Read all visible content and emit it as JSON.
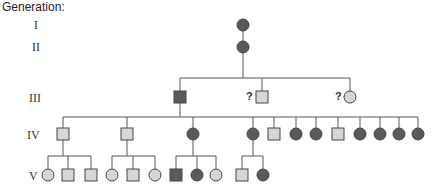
{
  "title": "Generation:",
  "generations": [
    "I",
    "II",
    "III",
    "IV",
    "V"
  ],
  "colors": {
    "affected": "#5a5a5a",
    "unaffected": "#d6d6d6",
    "stroke": "#444444",
    "line": "#555555"
  },
  "unknown_marker": "?",
  "legend": {
    "square": "male",
    "circle": "female",
    "dark": "affected",
    "light": "unaffected"
  },
  "individuals": {
    "I": [
      {
        "sex": "female",
        "affected": true
      }
    ],
    "II": [
      {
        "sex": "female",
        "affected": true
      }
    ],
    "III": [
      {
        "sex": "male",
        "affected": true
      },
      {
        "sex": "male",
        "affected": false,
        "unknown": true
      },
      {
        "sex": "female",
        "affected": false,
        "unknown": true
      }
    ],
    "IV": [
      {
        "sex": "male",
        "affected": false
      },
      {
        "sex": "male",
        "affected": false
      },
      {
        "sex": "female",
        "affected": true
      },
      {
        "sex": "female",
        "affected": true
      },
      {
        "sex": "male",
        "affected": false
      },
      {
        "sex": "female",
        "affected": true
      },
      {
        "sex": "female",
        "affected": true
      },
      {
        "sex": "male",
        "affected": false
      },
      {
        "sex": "female",
        "affected": true
      },
      {
        "sex": "female",
        "affected": true
      },
      {
        "sex": "female",
        "affected": true
      },
      {
        "sex": "female",
        "affected": true
      }
    ],
    "V": [
      {
        "sex": "female",
        "affected": false,
        "parent": "IV-1"
      },
      {
        "sex": "male",
        "affected": false,
        "parent": "IV-1"
      },
      {
        "sex": "male",
        "affected": false,
        "parent": "IV-1"
      },
      {
        "sex": "female",
        "affected": false,
        "parent": "IV-2"
      },
      {
        "sex": "male",
        "affected": false,
        "parent": "IV-2"
      },
      {
        "sex": "female",
        "affected": false,
        "parent": "IV-2"
      },
      {
        "sex": "male",
        "affected": true,
        "parent": "IV-3"
      },
      {
        "sex": "female",
        "affected": true,
        "parent": "IV-3"
      },
      {
        "sex": "female",
        "affected": false,
        "parent": "IV-3"
      },
      {
        "sex": "male",
        "affected": false,
        "parent": "IV-4"
      },
      {
        "sex": "female",
        "affected": true,
        "parent": "IV-4"
      }
    ]
  }
}
